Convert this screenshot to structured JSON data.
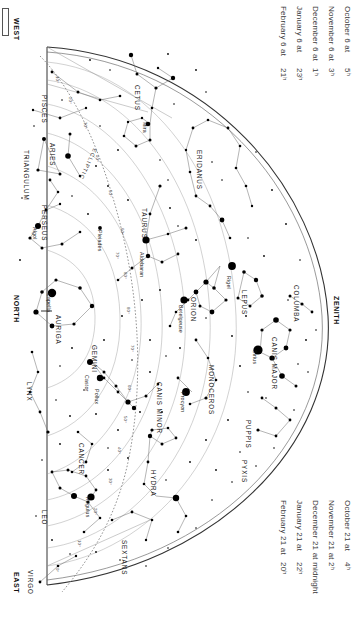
{
  "chart": {
    "orientation_note": "chart rotated 90 degrees",
    "directions": {
      "west": "WEST",
      "north": "NORTH",
      "east": "EAST",
      "zenith": "ZENITH"
    },
    "ecliptic_label": "ECLIPTIC"
  },
  "header_top": {
    "rows": [
      {
        "date": "October 6 at",
        "time": "5ʰ"
      },
      {
        "date": "November 6 at",
        "time": "3ʰ"
      },
      {
        "date": "December 6 at",
        "time": "1ʰ"
      },
      {
        "date": "January 6 at",
        "time": "23ʰ"
      },
      {
        "date": "February 6 at",
        "time": "21ʰ"
      }
    ]
  },
  "header_bottom": {
    "rows": [
      {
        "date": "October 21 at",
        "time": "4ʰ"
      },
      {
        "date": "November 21 at",
        "time": "2ʰ"
      },
      {
        "date": "December 21 at midnight",
        "time": ""
      },
      {
        "date": "January 21 at",
        "time": "22ʰ"
      },
      {
        "date": "February 21 at",
        "time": "20ʰ"
      }
    ]
  },
  "constellations": [
    {
      "name": "PISCES",
      "x": 48,
      "y": 95
    },
    {
      "name": "CETUS",
      "x": 141,
      "y": 85
    },
    {
      "name": "TRIANGULUM",
      "x": 30,
      "y": 150
    },
    {
      "name": "ARIES",
      "x": 56,
      "y": 143
    },
    {
      "name": "PERSEUS",
      "x": 48,
      "y": 205
    },
    {
      "name": "TAURUS",
      "x": 148,
      "y": 208
    },
    {
      "name": "ERIDANUS",
      "x": 203,
      "y": 150
    },
    {
      "name": "AURIGA",
      "x": 62,
      "y": 315
    },
    {
      "name": "ORION",
      "x": 197,
      "y": 297
    },
    {
      "name": "LEPUS",
      "x": 248,
      "y": 290
    },
    {
      "name": "COLUMBA",
      "x": 300,
      "y": 285
    },
    {
      "name": "GEMINI",
      "x": 98,
      "y": 345
    },
    {
      "name": "CANIS MAJOR",
      "x": 278,
      "y": 337
    },
    {
      "name": "MONOCEROS",
      "x": 215,
      "y": 365
    },
    {
      "name": "LYNX",
      "x": 33,
      "y": 382
    },
    {
      "name": "CANIS MINOR",
      "x": 163,
      "y": 382
    },
    {
      "name": "PUPPIS",
      "x": 252,
      "y": 420
    },
    {
      "name": "CANCER",
      "x": 85,
      "y": 443
    },
    {
      "name": "PYXIS",
      "x": 248,
      "y": 460
    },
    {
      "name": "HYDRA",
      "x": 157,
      "y": 470
    },
    {
      "name": "LEO",
      "x": 48,
      "y": 510
    },
    {
      "name": "SEXTANS",
      "x": 128,
      "y": 540
    },
    {
      "name": "VIRGO",
      "x": 34,
      "y": 570
    }
  ],
  "named_stars": [
    {
      "name": "Mira",
      "x": 148,
      "y": 122
    },
    {
      "name": "Pleiades",
      "x": 103,
      "y": 230
    },
    {
      "name": "Algol",
      "x": 38,
      "y": 227
    },
    {
      "name": "Aldebaran",
      "x": 145,
      "y": 252
    },
    {
      "name": "Capella",
      "x": 52,
      "y": 293
    },
    {
      "name": "Rigel",
      "x": 232,
      "y": 276
    },
    {
      "name": "Betelgeuse",
      "x": 184,
      "y": 305
    },
    {
      "name": "Sirius",
      "x": 258,
      "y": 350
    },
    {
      "name": "Castor",
      "x": 90,
      "y": 375
    },
    {
      "name": "Pollux",
      "x": 100,
      "y": 389
    },
    {
      "name": "Procyon",
      "x": 186,
      "y": 392
    },
    {
      "name": "Regulus",
      "x": 91,
      "y": 497
    }
  ],
  "altitude_labels": [
    {
      "text": "10°",
      "x": 60,
      "y": 76
    },
    {
      "text": "20°",
      "x": 73,
      "y": 97
    },
    {
      "text": "30°",
      "x": 88,
      "y": 122
    },
    {
      "text": "40°",
      "x": 100,
      "y": 155
    },
    {
      "text": "50°",
      "x": 113,
      "y": 190
    },
    {
      "text": "60°",
      "x": 125,
      "y": 228
    },
    {
      "text": "70°",
      "x": 120,
      "y": 252
    },
    {
      "text": "80°",
      "x": 128,
      "y": 272
    },
    {
      "text": "80°",
      "x": 131,
      "y": 307
    },
    {
      "text": "70°",
      "x": 135,
      "y": 345
    },
    {
      "text": "60°",
      "x": 132,
      "y": 385
    },
    {
      "text": "50°",
      "x": 128,
      "y": 416
    },
    {
      "text": "40°",
      "x": 122,
      "y": 447
    },
    {
      "text": "30°",
      "x": 113,
      "y": 478
    },
    {
      "text": "20°",
      "x": 98,
      "y": 508
    },
    {
      "text": "10°",
      "x": 82,
      "y": 540
    },
    {
      "text": "0°",
      "x": 60,
      "y": 568
    }
  ],
  "colors": {
    "background": "#ffffff",
    "star": "#000000",
    "line": "#555555",
    "horizon": "#333333",
    "text": "#1a1a1a"
  },
  "chart_data": {
    "type": "scatter",
    "xlabel": "",
    "ylabel": ""
  }
}
